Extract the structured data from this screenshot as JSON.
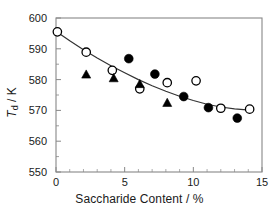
{
  "chart_data": {
    "type": "scatter",
    "title": "",
    "xlabel": "Saccharide Content / %",
    "ylabel": "Td / K",
    "ylabel_base": "T",
    "ylabel_sub": "d",
    "ylabel_unit": " / K",
    "xlim": [
      0,
      15
    ],
    "ylim": [
      550,
      600
    ],
    "xticks": [
      0,
      5,
      10,
      15
    ],
    "yticks": [
      550,
      560,
      570,
      580,
      590,
      600
    ],
    "xtick_labels": [
      "0",
      "5",
      "10",
      "15"
    ],
    "ytick_labels": [
      "550",
      "560",
      "570",
      "580",
      "590",
      "600"
    ],
    "grid": false,
    "legend": "none",
    "axis_color": "#888888",
    "marker_color": "#000000",
    "fit_line_color": "#333333",
    "series": [
      {
        "name": "open-circle",
        "marker": "circle-open",
        "color": "#000000",
        "points": [
          {
            "x": 0.1,
            "y": 595.5
          },
          {
            "x": 2.2,
            "y": 588.9
          },
          {
            "x": 4.1,
            "y": 583.0
          },
          {
            "x": 6.1,
            "y": 577.0
          },
          {
            "x": 8.1,
            "y": 579.0
          },
          {
            "x": 10.2,
            "y": 579.6
          },
          {
            "x": 12.0,
            "y": 570.7
          },
          {
            "x": 14.1,
            "y": 570.4
          }
        ]
      },
      {
        "name": "filled-circle",
        "marker": "circle-filled",
        "color": "#000000",
        "points": [
          {
            "x": 5.3,
            "y": 586.8
          },
          {
            "x": 7.2,
            "y": 581.8
          },
          {
            "x": 9.3,
            "y": 574.5
          },
          {
            "x": 11.1,
            "y": 570.9
          },
          {
            "x": 13.2,
            "y": 567.5
          }
        ]
      },
      {
        "name": "filled-triangle",
        "marker": "triangle-filled",
        "color": "#000000",
        "points": [
          {
            "x": 2.2,
            "y": 581.5
          },
          {
            "x": 4.2,
            "y": 580.3
          },
          {
            "x": 6.1,
            "y": 578.4
          },
          {
            "x": 8.1,
            "y": 572.3
          }
        ]
      }
    ],
    "fit_line": {
      "name": "trend-curve",
      "points": [
        {
          "x": 0.1,
          "y": 595.4
        },
        {
          "x": 1.0,
          "y": 592.6
        },
        {
          "x": 2.0,
          "y": 589.7
        },
        {
          "x": 3.0,
          "y": 587.0
        },
        {
          "x": 4.0,
          "y": 584.5
        },
        {
          "x": 5.0,
          "y": 582.2
        },
        {
          "x": 6.0,
          "y": 580.0
        },
        {
          "x": 7.0,
          "y": 578.0
        },
        {
          "x": 8.0,
          "y": 576.2
        },
        {
          "x": 9.0,
          "y": 574.6
        },
        {
          "x": 10.0,
          "y": 573.2
        },
        {
          "x": 11.0,
          "y": 572.0
        },
        {
          "x": 12.0,
          "y": 571.1
        },
        {
          "x": 13.0,
          "y": 570.5
        },
        {
          "x": 14.1,
          "y": 570.1
        }
      ]
    }
  }
}
